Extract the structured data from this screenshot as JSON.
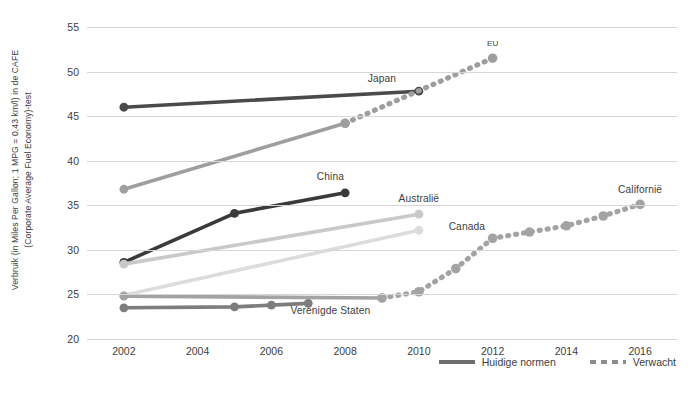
{
  "chart_data": {
    "type": "line",
    "title": "",
    "xlabel": "",
    "ylabel_line1": "Verbruik (in Miles Per Gallon; 1 MPG = 0,43 km/l) in de CAFE",
    "ylabel_line2": "(Corporate Average Fuel Economy)-test",
    "xlim": [
      2001,
      2017
    ],
    "ylim": [
      20,
      55
    ],
    "yticks": [
      20,
      25,
      30,
      35,
      40,
      45,
      50,
      55
    ],
    "xticks": [
      2002,
      2004,
      2006,
      2008,
      2010,
      2012,
      2014,
      2016
    ],
    "grid": true,
    "legend_position": "bottom-right",
    "series": [
      {
        "name": "Japan",
        "color": "#4a4a4a",
        "label_x": 2009.0,
        "label_y": 48.6,
        "current": {
          "style": "solid",
          "x": [
            2002,
            2010
          ],
          "y": [
            46.0,
            47.8
          ]
        },
        "expected": {
          "style": "dashed",
          "x": [],
          "y": []
        }
      },
      {
        "name": "EU",
        "color": "#9e9e9e",
        "label_x": 2012.0,
        "label_y": 52.6,
        "label_size": "small",
        "current": {
          "style": "solid",
          "x": [
            2002,
            2008
          ],
          "y": [
            36.8,
            44.2
          ]
        },
        "expected": {
          "style": "dashed",
          "x": [
            2008,
            2012
          ],
          "y": [
            44.2,
            51.5
          ]
        }
      },
      {
        "name": "China",
        "color": "#3a3a3a",
        "label_x": 2007.6,
        "label_y": 37.6,
        "current": {
          "style": "solid",
          "x": [
            2002,
            2005,
            2008
          ],
          "y": [
            28.6,
            34.1,
            36.4
          ]
        },
        "expected": {
          "style": "dashed",
          "x": [],
          "y": []
        }
      },
      {
        "name": "Australië",
        "color": "#c9c9c9",
        "label_x": 2010.0,
        "label_y": 35.1,
        "current": {
          "style": "solid",
          "x": [
            2002,
            2010
          ],
          "y": [
            28.4,
            34.0
          ]
        },
        "expected": {
          "style": "dashed",
          "x": [],
          "y": []
        }
      },
      {
        "name": "Canada",
        "color": "#dcdcdc",
        "label_x": 2011.3,
        "label_y": 32.0,
        "current": {
          "style": "solid",
          "x": [
            2002,
            2010
          ],
          "y": [
            24.9,
            32.2
          ]
        },
        "expected": {
          "style": "dashed",
          "x": [],
          "y": []
        }
      },
      {
        "name": "Californië",
        "color": "#a3a3a3",
        "label_x": 2016.0,
        "label_y": 36.2,
        "current": {
          "style": "solid",
          "x": [
            2002,
            2009
          ],
          "y": [
            24.8,
            24.6
          ]
        },
        "expected": {
          "style": "dashed",
          "x": [
            2009,
            2010,
            2011,
            2012,
            2013,
            2014,
            2015,
            2016
          ],
          "y": [
            24.6,
            25.3,
            27.9,
            31.3,
            32.0,
            32.7,
            33.8,
            35.1
          ]
        }
      },
      {
        "name": "Verenigde Staten",
        "color": "#7d7d7d",
        "label_x": 2007.6,
        "label_y": 22.6,
        "current": {
          "style": "solid",
          "x": [
            2002,
            2005,
            2006,
            2007
          ],
          "y": [
            23.5,
            23.6,
            23.8,
            24.0
          ]
        },
        "expected": {
          "style": "dashed",
          "x": [],
          "y": []
        }
      }
    ],
    "legend": [
      {
        "label": "Huidige normen",
        "style": "solid",
        "color": "#6e6e6e"
      },
      {
        "label": "Verwacht",
        "style": "dashed",
        "color": "#8c8c8c"
      }
    ]
  }
}
